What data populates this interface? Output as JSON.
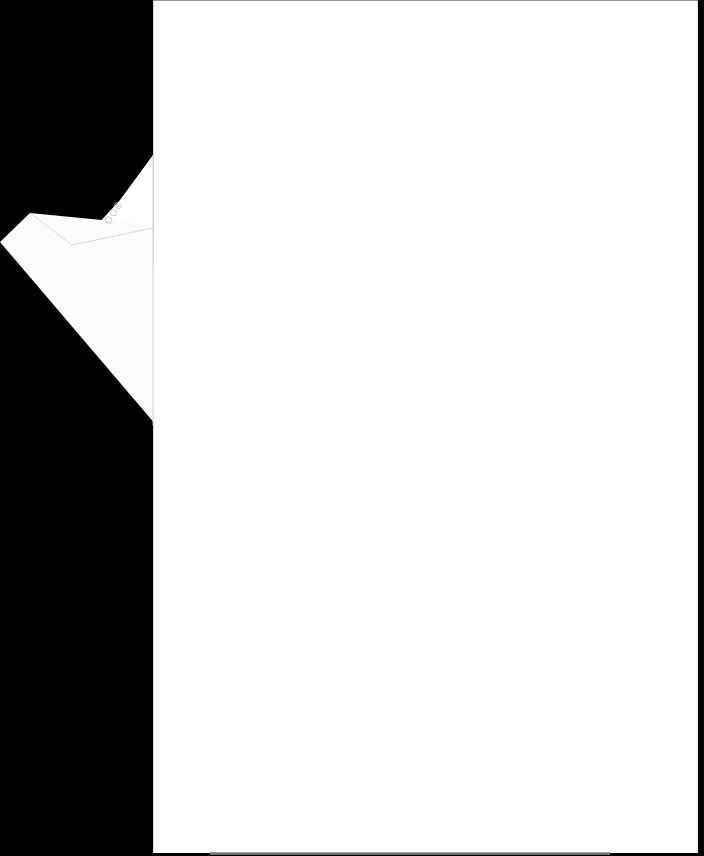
{
  "document": {
    "type": "scanned-page",
    "content": "",
    "fold_flap_mark": "SOO",
    "colors": {
      "background": "#000000",
      "page": "#ffffff",
      "fold_shadow": "#e6e6e6"
    }
  }
}
